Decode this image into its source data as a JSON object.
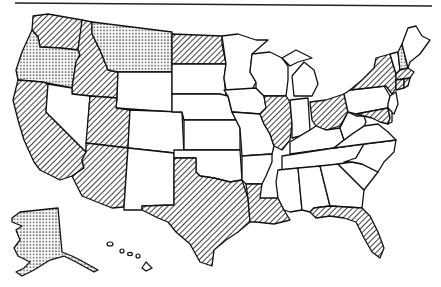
{
  "map": {
    "title": "United States",
    "top_rule": true,
    "legend_categories": [
      {
        "key": "hatched",
        "pattern": "diagonal-hatch"
      },
      {
        "key": "dotted",
        "pattern": "dot-stipple"
      },
      {
        "key": "blank",
        "pattern": "none"
      }
    ],
    "states": {
      "hatched": [
        "WA",
        "ID",
        "CA",
        "UT",
        "AZ",
        "ND",
        "TX",
        "LA",
        "IL",
        "OH",
        "NY",
        "MA",
        "CT",
        "RI",
        "MD",
        "FL"
      ],
      "dotted": [
        "OR",
        "MT",
        "NH",
        "AK"
      ],
      "blank": [
        "NV",
        "WY",
        "CO",
        "NM",
        "SD",
        "NE",
        "KS",
        "OK",
        "MN",
        "IA",
        "MO",
        "AR",
        "WI",
        "MI",
        "IN",
        "KY",
        "TN",
        "MS",
        "AL",
        "GA",
        "SC",
        "NC",
        "VA",
        "WV",
        "PA",
        "NJ",
        "DE",
        "VT",
        "ME",
        "HI"
      ]
    },
    "colors": {
      "stroke": "#111111",
      "fill_blank": "#ffffff",
      "hatch": "#111111",
      "dot": "#222222"
    }
  }
}
